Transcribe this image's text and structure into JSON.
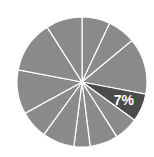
{
  "chart_data": {
    "type": "pie",
    "title": "",
    "start_angle_deg": 0,
    "direction": "clockwise",
    "categories": [
      "s1",
      "s2",
      "s3",
      "s4",
      "s5",
      "s6",
      "s7",
      "s8",
      "s9",
      "s10",
      "s11",
      "s12"
    ],
    "values": [
      7,
      7,
      14,
      7,
      6,
      7,
      4,
      8,
      7,
      11,
      13,
      9
    ],
    "highlighted_index": 3,
    "labels": [
      {
        "index": 3,
        "text": "7%"
      }
    ],
    "colors": {
      "default": "#8a8a8a",
      "highlight": "#4b4b4b",
      "separator": "#ffffff"
    },
    "legend": null
  }
}
